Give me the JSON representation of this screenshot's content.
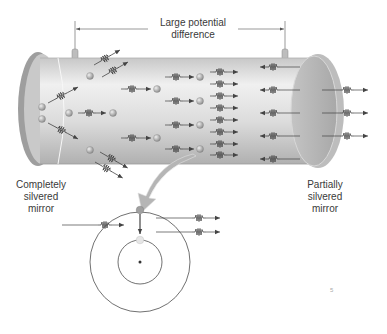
{
  "figure": {
    "labels": {
      "top_line1": "Large potential",
      "top_line2": "difference",
      "left_line1": "Completely",
      "left_line2": "silvered",
      "left_line3": "mirror",
      "right_line1": "Partially",
      "right_line2": "silvered",
      "right_line3": "mirror",
      "page_mark": "5"
    },
    "colors": {
      "tube_body": "#d9d9d9",
      "tube_highlight": "#f2f2f2",
      "tube_shadow": "#a9a9a9",
      "mirror": "#b8b8b8",
      "atom": "#9a9a9a",
      "line": "#444444",
      "callout_arrow": "#b5b5b5"
    },
    "components": [
      "laser-tube",
      "completely-silvered-mirror",
      "partially-silvered-mirror",
      "electrodes",
      "excited-atoms",
      "photon-waves",
      "atom-energy-level-inset"
    ]
  }
}
